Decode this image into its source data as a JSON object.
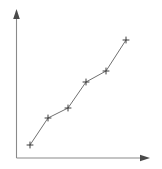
{
  "chart_data": {
    "type": "line",
    "title": "",
    "subtitle": "",
    "xlabel": "",
    "ylabel": "",
    "grid": false,
    "legend": null,
    "legend_position": "none",
    "marker": "plus",
    "line_color": "#707070",
    "marker_color": "#3c3c3c",
    "axis_color": "#8a8a8a",
    "background_color": "#ffffff",
    "xlim": [
      0,
      10
    ],
    "ylim": [
      0,
      10
    ],
    "x_tick_labels": [],
    "y_tick_labels": [],
    "annotations": [],
    "x": [
      1.0,
      2.4,
      4.0,
      5.3,
      6.8,
      8.3
    ],
    "y": [
      1.1,
      3.0,
      3.7,
      5.5,
      6.3,
      8.5
    ],
    "points": [
      {
        "x": 1.0,
        "y": 1.1,
        "px": 30,
        "py": 145
      },
      {
        "x": 2.4,
        "y": 3.0,
        "px": 48,
        "py": 118
      },
      {
        "x": 4.0,
        "y": 3.7,
        "px": 68,
        "py": 108
      },
      {
        "x": 5.3,
        "y": 5.5,
        "px": 86,
        "py": 82
      },
      {
        "x": 6.8,
        "y": 6.3,
        "px": 106,
        "py": 71
      },
      {
        "x": 8.3,
        "y": 8.5,
        "px": 126,
        "py": 40
      }
    ],
    "axes": {
      "origin_px": {
        "x": 16,
        "y": 158
      },
      "x_axis_end_px": {
        "x": 150,
        "y": 158
      },
      "y_axis_end_px": {
        "x": 16,
        "y": 9
      },
      "x_arrow": true,
      "y_arrow": true
    }
  }
}
